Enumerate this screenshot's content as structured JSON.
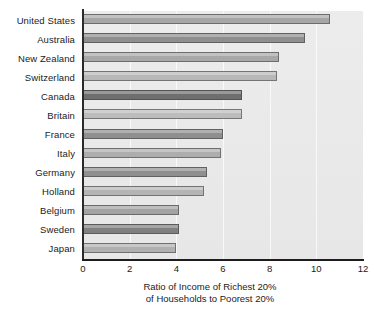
{
  "chart_data": {
    "type": "bar",
    "orientation": "horizontal",
    "title": "",
    "xlabel_line1": "Ratio of Income of Richest 20%",
    "xlabel_line2": "of Households to Poorest 20%",
    "ylabel": "",
    "xlim": [
      0,
      12
    ],
    "xticks": [
      "0",
      "2",
      "4",
      "6",
      "8",
      "10",
      "12"
    ],
    "xtick_values": [
      0,
      2,
      4,
      6,
      8,
      10,
      12
    ],
    "grid": "vertical-light",
    "legend": "none",
    "categories": [
      "United States",
      "Australia",
      "New Zealand",
      "Switzerland",
      "Canada",
      "Britain",
      "France",
      "Italy",
      "Germany",
      "Holland",
      "Belgium",
      "Sweden",
      "Japan"
    ],
    "values": [
      10.6,
      9.5,
      8.4,
      8.3,
      6.8,
      6.8,
      6.0,
      5.9,
      5.3,
      5.2,
      4.1,
      4.1,
      4.0
    ],
    "bar_colors": [
      "#a6a6a6",
      "#8f8f8f",
      "#a8a8a8",
      "#b8b8b8",
      "#6e6e6e",
      "#bcbcbc",
      "#8f8f8f",
      "#adadad",
      "#909090",
      "#b5b5b5",
      "#a3a3a3",
      "#808080",
      "#b0b0b0"
    ],
    "plot_background": "#eaeaeb",
    "axis_color": "#1d1d1d",
    "text_color": "#1b1b1b"
  }
}
